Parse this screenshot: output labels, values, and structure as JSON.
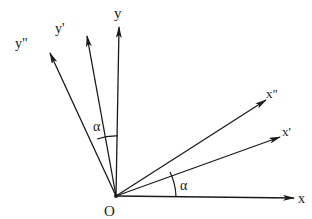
{
  "diagram": {
    "type": "coordinate-axes-rotation",
    "origin": {
      "label": "O",
      "x": 116,
      "y": 196,
      "label_x": 104,
      "label_y": 216
    },
    "stroke_color": "#1a1a1a",
    "axes": [
      {
        "id": "x",
        "label": "x",
        "end_x": 294,
        "end_y": 198,
        "label_x": 298,
        "label_y": 203
      },
      {
        "id": "x1",
        "label": "x'",
        "end_x": 280,
        "end_y": 137,
        "label_x": 282,
        "label_y": 136
      },
      {
        "id": "x2",
        "label": "x\"",
        "end_x": 266,
        "end_y": 100,
        "label_x": 266,
        "label_y": 98
      },
      {
        "id": "y",
        "label": "y",
        "end_x": 119,
        "end_y": 27,
        "label_x": 114,
        "label_y": 18
      },
      {
        "id": "y1",
        "label": "y'",
        "end_x": 87,
        "end_y": 36,
        "label_x": 55,
        "label_y": 33
      },
      {
        "id": "y2",
        "label": "y\"",
        "end_x": 50,
        "end_y": 53,
        "label_x": 15,
        "label_y": 48
      }
    ],
    "angles": [
      {
        "id": "alpha-x",
        "label": "α",
        "between": [
          "x",
          "x'"
        ],
        "label_x": 180,
        "label_y": 190
      },
      {
        "id": "alpha-y",
        "label": "α",
        "between": [
          "y",
          "y'"
        ],
        "label_x": 93,
        "label_y": 131
      }
    ]
  }
}
